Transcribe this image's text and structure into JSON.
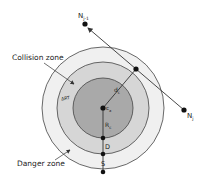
{
  "diagram": {
    "labels": {
      "collision_zone": "Collision zone",
      "danger_zone": "Danger zone",
      "node_prev": "N",
      "node_prev_sub": "j-1",
      "node_curr": "N",
      "node_curr_sub": "j",
      "distance": "d",
      "distance_sub": "c",
      "center": "c",
      "center_sub": "a",
      "radius": "R",
      "radius_sub": "c",
      "d_gap": "D",
      "s_gap": "S",
      "ring_tag": "ΔRT"
    },
    "colors": {
      "outer_zone": "#f0f0f0",
      "middle_zone": "#d6d6d6",
      "inner_zone": "#a9a9a9",
      "stroke": "#333333",
      "point": "#111111"
    },
    "geometry": {
      "center": [
        103,
        108
      ],
      "radii": {
        "inner": 30,
        "middle": 46,
        "outer": 61
      },
      "node_prev": [
        85,
        24
      ],
      "node_curr": [
        184,
        110
      ],
      "foot_point": [
        136,
        69
      ]
    }
  }
}
